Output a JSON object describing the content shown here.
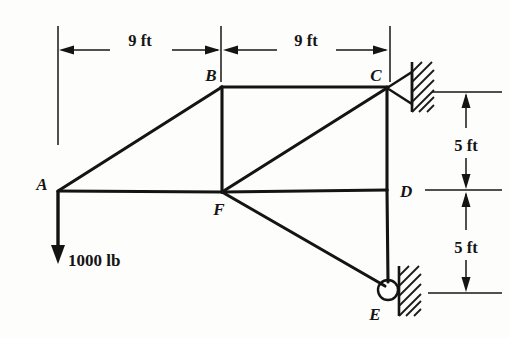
{
  "figure": {
    "type": "truss-free-body-diagram",
    "background_color": "#fdfdfb",
    "line_color": "#141414",
    "width": 509,
    "height": 338
  },
  "nodes": [
    {
      "id": "A",
      "label": "A",
      "x": 58,
      "y": 191,
      "label_x": 42,
      "label_y": 190
    },
    {
      "id": "B",
      "label": "B",
      "x": 222,
      "y": 87,
      "label_x": 207,
      "label_y": 80
    },
    {
      "id": "C",
      "label": "C",
      "x": 387,
      "y": 87,
      "label_x": 372,
      "label_y": 80
    },
    {
      "id": "D",
      "label": "D",
      "x": 387,
      "y": 190,
      "label_x": 397,
      "label_y": 196
    },
    {
      "id": "E",
      "label": "E",
      "x": 388,
      "y": 290,
      "label_x": 372,
      "label_y": 317
    },
    {
      "id": "F",
      "label": "F",
      "x": 222,
      "y": 192,
      "label_x": 214,
      "label_y": 214
    }
  ],
  "members": [
    {
      "name": "member-AB",
      "from": "A",
      "to": "B"
    },
    {
      "name": "member-AF",
      "from": "A",
      "to": "F"
    },
    {
      "name": "member-BC",
      "from": "B",
      "to": "C"
    },
    {
      "name": "member-BF",
      "from": "B",
      "to": "F"
    },
    {
      "name": "member-FC",
      "from": "F",
      "to": "C"
    },
    {
      "name": "member-FD",
      "from": "F",
      "to": "D"
    },
    {
      "name": "member-FE",
      "from": "F",
      "to": "E"
    },
    {
      "name": "member-CD",
      "from": "C",
      "to": "D"
    },
    {
      "name": "member-DE",
      "from": "D",
      "to": "E"
    }
  ],
  "load": {
    "label": "1000 lb",
    "applied_at": "A",
    "direction": "down",
    "magnitude": 1000,
    "units": "lb",
    "label_x": 66,
    "label_y": 264,
    "start_x": 58,
    "start_y": 191,
    "end_y": 262
  },
  "supports": [
    {
      "name": "pin-support-C",
      "at": "C",
      "kind": "pin",
      "x": 387,
      "y": 87
    },
    {
      "name": "roller-support-E",
      "at": "E",
      "kind": "roller",
      "x": 388,
      "y": 290
    }
  ],
  "dimensions": {
    "horizontal": [
      {
        "name": "dim-9ft-left",
        "label": "9 ft",
        "from_x": 58,
        "to_x": 222,
        "y": 50,
        "label_x": 140,
        "label_y": 46
      },
      {
        "name": "dim-9ft-right",
        "label": "9 ft",
        "from_x": 222,
        "to_x": 390,
        "y": 50,
        "label_x": 306,
        "label_y": 46
      }
    ],
    "vertical": [
      {
        "name": "dim-5ft-upper",
        "label": "5 ft",
        "from_y": 92,
        "to_y": 190,
        "x": 466,
        "label_x": 466,
        "label_y": 146
      },
      {
        "name": "dim-5ft-lower",
        "label": "5 ft",
        "from_y": 190,
        "to_y": 293,
        "x": 466,
        "label_x": 466,
        "label_y": 248
      }
    ]
  },
  "extension_lines": {
    "left": {
      "x": 58,
      "y1": 26,
      "y2": 145
    },
    "middle": {
      "x": 221,
      "y1": 26,
      "y2": 82
    },
    "right": {
      "x": 390,
      "y1": 26,
      "y2": 82
    }
  },
  "dimension_ticks": [
    {
      "name": "tick-top",
      "x1": 432,
      "x2": 502,
      "y": 92
    },
    {
      "name": "tick-middle",
      "x1": 425,
      "x2": 502,
      "y": 190
    },
    {
      "name": "tick-bottom",
      "x1": 428,
      "x2": 502,
      "y": 293
    }
  ]
}
